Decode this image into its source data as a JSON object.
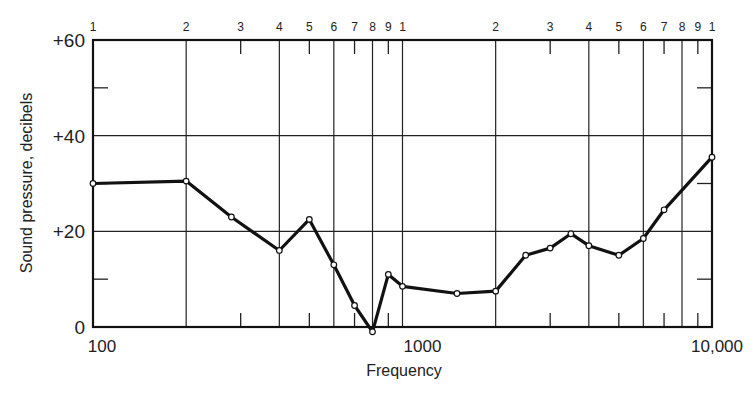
{
  "chart_data": {
    "type": "line",
    "title": "",
    "xlabel": "Frequency",
    "ylabel": "Sound pressure, decibels",
    "x_scale": "log",
    "xlim": [
      100,
      10000
    ],
    "ylim": [
      0,
      60
    ],
    "grid": true,
    "legend": null,
    "y_tick_labels": [
      "0",
      "+20",
      "+40",
      "+60"
    ],
    "y_ticks": [
      0,
      20,
      40,
      60
    ],
    "y_minor_ticks": [
      10,
      30,
      50
    ],
    "x_bottom_tick_labels": [
      "100",
      "1000",
      "10,000"
    ],
    "x_bottom_ticks": [
      100,
      1000,
      10000
    ],
    "x_top_tick_labels": [
      "1",
      "2",
      "3",
      "4",
      "5",
      "6",
      "7",
      "8",
      "9",
      "1",
      "2",
      "3",
      "4",
      "5",
      "6",
      "7",
      "8",
      "9",
      "1"
    ],
    "x_top_ticks": [
      100,
      200,
      300,
      400,
      500,
      600,
      700,
      800,
      900,
      1000,
      2000,
      3000,
      4000,
      5000,
      6000,
      7000,
      8000,
      9000,
      10000
    ],
    "x_full_gridlines": [
      200,
      400,
      600,
      800,
      1000,
      2000,
      4000,
      6000,
      8000
    ],
    "x_short_ticks": [
      300,
      500,
      700,
      900,
      3000,
      5000,
      7000,
      9000
    ],
    "series": [
      {
        "name": "Sound pressure",
        "x": [
          100,
          200,
          280,
          400,
          500,
          600,
          700,
          800,
          900,
          1000,
          1500,
          2000,
          2500,
          3000,
          3500,
          4000,
          5000,
          6000,
          7000,
          10000
        ],
        "values": [
          30,
          30.5,
          23,
          16,
          22.5,
          13,
          4.5,
          -1,
          11,
          8.5,
          7,
          7.5,
          15,
          16.5,
          19.5,
          17,
          15,
          18.5,
          24.5,
          35.5
        ]
      }
    ]
  }
}
